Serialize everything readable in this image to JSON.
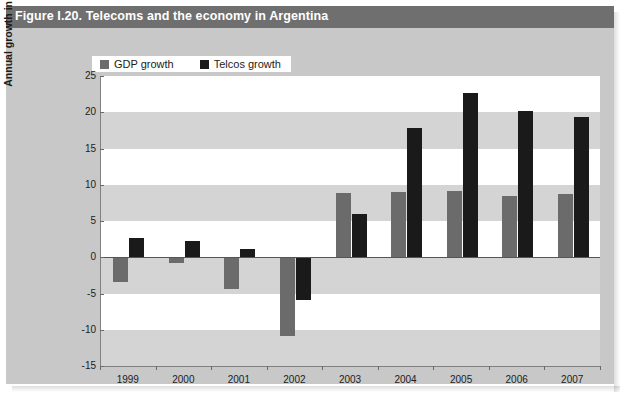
{
  "figure": {
    "title": "Figure I.20. Telecoms and the economy in Argentina"
  },
  "chart_data": {
    "type": "bar",
    "title": "Figure I.20. Telecoms and the economy in Argentina",
    "xlabel": "",
    "ylabel": "Annual growth in per cent",
    "categories": [
      "1999",
      "2000",
      "2001",
      "2002",
      "2003",
      "2004",
      "2005",
      "2006",
      "2007"
    ],
    "series": [
      {
        "name": "GDP growth",
        "color": "#6b6b6b",
        "values": [
          -3.4,
          -0.8,
          -4.4,
          -10.9,
          8.8,
          9.0,
          9.2,
          8.5,
          8.7
        ]
      },
      {
        "name": "Telcos growth",
        "color": "#1a1a1a",
        "values": [
          2.7,
          2.2,
          1.1,
          -5.9,
          6.0,
          17.8,
          22.6,
          20.2,
          19.3
        ]
      }
    ],
    "ylim": [
      -15,
      25
    ],
    "ytick_step": 5,
    "yticks": [
      "25",
      "20",
      "15",
      "10",
      "5",
      "0",
      "-5",
      "-10",
      "-15"
    ],
    "grid": "horizontal-bands",
    "legend_position": "top-left"
  },
  "colors": {
    "title_bar": "#6f6f6f",
    "card_background": "#c8c8c8",
    "plot_background": "#ffffff",
    "band": "#d4d4d4",
    "gdp": "#6b6b6b",
    "telcos": "#1a1a1a",
    "axis": "#808080"
  }
}
